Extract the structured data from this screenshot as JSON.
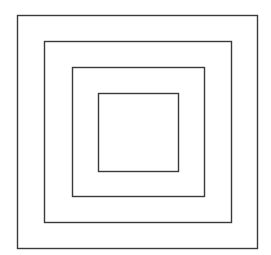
{
  "diagram": {
    "type": "nested-squares",
    "background": "#ffffff",
    "stroke_color": "#3a3a3a",
    "stroke_width": 1.4,
    "squares": [
      {
        "name": "outer-square",
        "x": 17.5,
        "y": 15.5,
        "w": 240,
        "h": 233
      },
      {
        "name": "second-square",
        "x": 44.5,
        "y": 41.5,
        "w": 187,
        "h": 181
      },
      {
        "name": "third-square",
        "x": 72.5,
        "y": 67.5,
        "w": 132,
        "h": 129
      },
      {
        "name": "inner-square",
        "x": 98.5,
        "y": 93.5,
        "w": 80,
        "h": 78
      }
    ]
  }
}
